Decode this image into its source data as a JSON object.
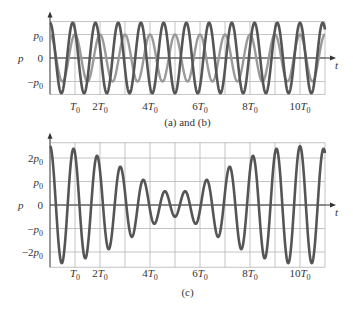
{
  "chart_data": [
    {
      "type": "line",
      "title": "(a) and (b)",
      "xlabel": "t",
      "ylabel": "p",
      "x_unit": "T0",
      "xlim": [
        0,
        11
      ],
      "ylim": [
        -1.5,
        1.5
      ],
      "grid": true,
      "x_ticks": [
        1,
        2,
        4,
        6,
        8,
        10
      ],
      "x_tick_labels": [
        "T0",
        "2T0",
        "4T0",
        "6T0",
        "8T0",
        "10T0"
      ],
      "y_ticks": [
        1,
        0,
        -1
      ],
      "y_tick_labels": [
        "p0",
        "0",
        "−p0"
      ],
      "series": [
        {
          "name": "(a)",
          "amplitude": 1.0,
          "frequency": 1.0,
          "function": "p0·cos(2πt/T0)",
          "color": "#9a9a9a"
        },
        {
          "name": "(b)",
          "amplitude": 1.5,
          "frequency": 1.1,
          "function": "1.5p0·cos(2π·1.1t/T0)",
          "color": "#555555"
        }
      ]
    },
    {
      "type": "line",
      "title": "(c)",
      "xlabel": "t",
      "ylabel": "p",
      "x_unit": "T0",
      "xlim": [
        0,
        11
      ],
      "ylim": [
        -2.6,
        2.6
      ],
      "grid": true,
      "x_ticks": [
        1,
        2,
        4,
        6,
        8,
        10
      ],
      "x_tick_labels": [
        "T0",
        "2T0",
        "4T0",
        "6T0",
        "8T0",
        "10T0"
      ],
      "y_ticks": [
        2,
        1,
        0,
        -1,
        -2
      ],
      "y_tick_labels": [
        "2p0",
        "p0",
        "0",
        "−p0",
        "−2p0"
      ],
      "series": [
        {
          "name": "(c) = (a) + (b)",
          "components": [
            "(a)",
            "(b)"
          ],
          "function": "p0·cos(2πt/T0) + 1.5p0·cos(2π·1.1t/T0)",
          "max_envelope": 2.5,
          "min_envelope": 0.5,
          "min_envelope_at": 5,
          "color": "#555555"
        }
      ]
    }
  ],
  "labels": {
    "y_axis": "p",
    "x_axis": "t",
    "caption_top": "(a) and (b)",
    "caption_bottom": "(c)"
  },
  "colors": {
    "grid": "#b4b4b4",
    "axis": "#333333",
    "curve_dark": "#555555",
    "curve_light": "#9a9a9a"
  }
}
